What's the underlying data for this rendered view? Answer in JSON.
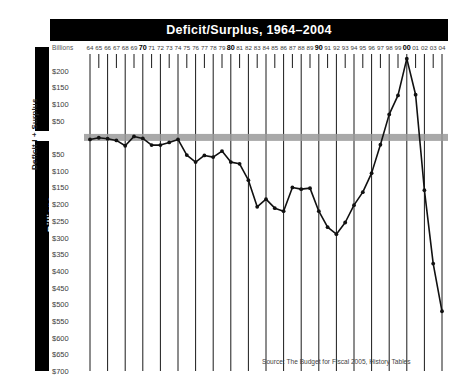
{
  "header": {
    "title": "Deficit/Surplus, 1964–2004"
  },
  "axis": {
    "units_label": "Billions",
    "vertical_bar_label": "Billions",
    "rotated_axis_title": "Deficit I + Surplus",
    "y_tick_labels": [
      "$200",
      "$150",
      "$100",
      "$50",
      "$50",
      "$100",
      "$150",
      "$200",
      "$250",
      "$300",
      "$350",
      "$400",
      "$450",
      "$500",
      "$550",
      "$600",
      "$650",
      "$700"
    ]
  },
  "footer": {
    "source": "Source: The Budget for Fiscal 2005, History Tables"
  },
  "colors": {
    "title_bar_bg": "#000000",
    "title_bar_text": "#ffffff",
    "zero_band": "#9a9a9a",
    "line": "#111111",
    "gridline": "#1a1a1a",
    "plot_bg": "#ffffff",
    "sidebar_bar": "#000000"
  },
  "chart_data": {
    "type": "line",
    "title": "Deficit/Surplus, 1964–2004",
    "xlabel": "",
    "ylabel": "Billions",
    "ylim": [
      -700,
      250
    ],
    "yticks": [
      200,
      150,
      100,
      50,
      0,
      -50,
      -100,
      -150,
      -200,
      -250,
      -300,
      -350,
      -400,
      -450,
      -500,
      -550,
      -600,
      -650,
      -700
    ],
    "ytick_labels": [
      "$200",
      "$150",
      "$100",
      "$50",
      "",
      "$50",
      "$100",
      "$150",
      "$200",
      "$250",
      "$300",
      "$350",
      "$400",
      "$450",
      "$500",
      "$550",
      "$600",
      "$650",
      "$700"
    ],
    "grid": "vertical-every-5-years",
    "zero_band": true,
    "legend": null,
    "categories": [
      "64",
      "65",
      "66",
      "67",
      "68",
      "69",
      "70",
      "71",
      "72",
      "73",
      "74",
      "75",
      "76",
      "77",
      "78",
      "79",
      "80",
      "81",
      "82",
      "83",
      "84",
      "85",
      "86",
      "87",
      "88",
      "89",
      "90",
      "91",
      "92",
      "93",
      "94",
      "95",
      "96",
      "97",
      "98",
      "99",
      "00",
      "01",
      "02",
      "03",
      "04"
    ],
    "bold_categories": [
      "70",
      "80",
      "90",
      "00"
    ],
    "values": [
      -6,
      -1,
      -4,
      -9,
      -25,
      3,
      -3,
      -23,
      -23,
      -15,
      -6,
      -53,
      -74,
      -54,
      -59,
      -41,
      -74,
      -79,
      -128,
      -208,
      -185,
      -212,
      -221,
      -150,
      -155,
      -152,
      -221,
      -269,
      -290,
      -255,
      -203,
      -164,
      -107,
      -22,
      69,
      126,
      236,
      128,
      -158,
      -378,
      -521
    ],
    "units": "billions of dollars"
  }
}
